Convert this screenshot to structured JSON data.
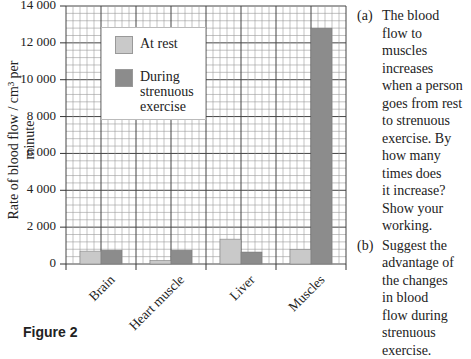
{
  "chart_data": {
    "type": "bar",
    "title": "",
    "xlabel": "",
    "ylabel": "Rate of blood flow / cm³ per minute",
    "categories": [
      "Brain",
      "Heart muscle",
      "Liver",
      "Muscles"
    ],
    "series": [
      {
        "name": "At rest",
        "color": "#c9c9c9",
        "values": [
          700,
          200,
          1350,
          800
        ]
      },
      {
        "name": "During strenuous exercise",
        "color": "#8c8c8c",
        "values": [
          750,
          750,
          650,
          12800
        ]
      }
    ],
    "ylim": [
      0,
      14000
    ],
    "yticks": [
      0,
      2000,
      4000,
      6000,
      8000,
      10000,
      12000,
      14000
    ],
    "ytick_labels": [
      "0",
      "2 000",
      "4 000",
      "6 000",
      "8 000",
      "10 000",
      "12 000",
      "14 000"
    ],
    "grid": true,
    "legend_position": "upper left inside plot"
  },
  "legend": {
    "rest_label": "At rest",
    "exercise_label_lines": [
      "During",
      "strenuous",
      "exercise"
    ]
  },
  "questions": [
    {
      "number": "(a)",
      "lines": [
        "The blood",
        "flow to",
        "muscles",
        "increases",
        "when a person",
        "goes from rest",
        "to strenuous",
        "exercise. By",
        "how many",
        "times does",
        "it increase?",
        "Show your",
        "working."
      ]
    },
    {
      "number": "(b)",
      "lines": [
        "Suggest the",
        "advantage of",
        "the changes",
        "in blood",
        "flow during",
        "strenuous",
        "exercise."
      ]
    }
  ],
  "figure_label": "Figure 2"
}
